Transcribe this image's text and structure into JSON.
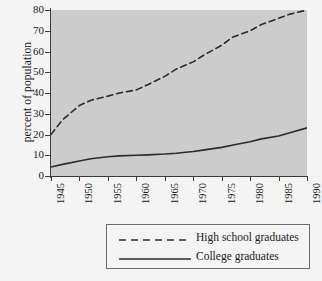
{
  "chart_data": {
    "type": "line",
    "title": "",
    "xlabel": "",
    "ylabel": "percent of population",
    "xlim": [
      1945,
      1990
    ],
    "ylim": [
      0,
      80
    ],
    "grid": false,
    "legend_position": "below",
    "xticks": [
      "1945",
      "1950",
      "1955",
      "1960",
      "1965",
      "1970",
      "1975",
      "1980",
      "1985",
      "1990"
    ],
    "yticks": [
      "0",
      "10",
      "20",
      "30",
      "40",
      "50",
      "60",
      "70",
      "80"
    ],
    "x": [
      1945,
      1947,
      1950,
      1952,
      1955,
      1957,
      1960,
      1962,
      1965,
      1967,
      1970,
      1972,
      1975,
      1977,
      1980,
      1982,
      1985,
      1987,
      1990
    ],
    "series": [
      {
        "name": "High school graduates",
        "style": "dashed",
        "color": "#2b2b2b",
        "values": [
          20,
          27,
          34,
          36.5,
          38.5,
          40,
          41.5,
          44,
          48,
          51.5,
          55,
          58.5,
          63,
          67,
          70,
          73,
          76,
          78,
          80
        ]
      },
      {
        "name": "College graduates",
        "style": "solid",
        "color": "#2b2b2b",
        "values": [
          4.3,
          5.6,
          7.2,
          8.3,
          9.3,
          9.7,
          10,
          10.2,
          10.6,
          11,
          11.8,
          12.6,
          13.8,
          14.9,
          16.5,
          17.9,
          19.3,
          20.8,
          23.2
        ]
      }
    ]
  },
  "legend": {
    "entries": [
      {
        "label": "High school graduates",
        "style": "dashed"
      },
      {
        "label": "College graduates",
        "style": "solid"
      }
    ]
  },
  "colors": {
    "plot_background": "#cccccc",
    "page_background": "#f4f4f4",
    "axis": "#3a3a3a",
    "series": "#2b2b2b",
    "legend_border": "#6a6a6a"
  }
}
